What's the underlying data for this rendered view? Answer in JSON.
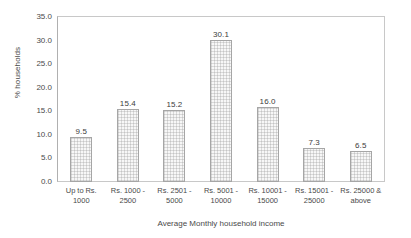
{
  "chart_data": {
    "type": "bar",
    "title": "",
    "subtitle": "",
    "xlabel": "Average Monthly household income",
    "ylabel": "% households",
    "categories": [
      "Up to Rs. 1000",
      "Rs. 1000 - 2500",
      "Rs. 2501 - 5000",
      "Rs. 5001 - 10000",
      "Rs. 10001 - 15000",
      "Rs. 15001 - 25000",
      "Rs. 25000 & above"
    ],
    "category_lines": [
      [
        "Up to Rs.",
        "1000"
      ],
      [
        "Rs. 1000 -",
        "2500"
      ],
      [
        "Rs. 2501 -",
        "5000"
      ],
      [
        "Rs. 5001 -",
        "10000"
      ],
      [
        "Rs. 10001 -",
        "15000"
      ],
      [
        "Rs. 15001 -",
        "25000"
      ],
      [
        "Rs. 25000 &",
        "above"
      ]
    ],
    "values": [
      9.5,
      15.4,
      15.2,
      30.1,
      16.0,
      7.3,
      6.5
    ],
    "value_labels": [
      "9.5",
      "15.4",
      "15.2",
      "30.1",
      "16.0",
      "7.3",
      "6.5"
    ],
    "ylim": [
      0.0,
      35.0
    ],
    "ytick_values": [
      0.0,
      5.0,
      10.0,
      15.0,
      20.0,
      25.0,
      30.0,
      35.0
    ],
    "ytick_labels": [
      "0.0",
      "5.0",
      "10.0",
      "15.0",
      "20.0",
      "25.0",
      "30.0",
      "35.0"
    ],
    "grid": false,
    "legend": false,
    "legend_position": "none",
    "data_labels": true,
    "colors": {
      "bar_fill": "#f7f7f7",
      "bar_pattern": "#969696",
      "bar_border": "#a6a6a6",
      "plot_border": "#c8c8c8",
      "text": "#4a4a4a",
      "background": "#ffffff"
    }
  }
}
